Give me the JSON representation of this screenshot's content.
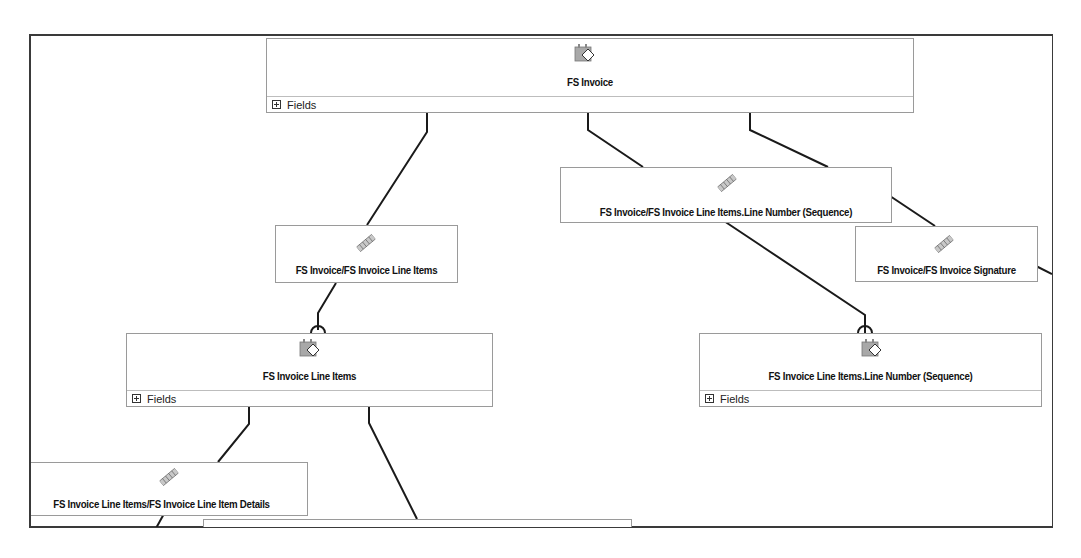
{
  "diagram": {
    "entities": [
      {
        "id": "fs-invoice",
        "title": "FS Invoice",
        "fields_label": "Fields",
        "icon": "entity-tag-icon"
      },
      {
        "id": "fs-invoice-line-items",
        "title": "FS Invoice Line Items",
        "fields_label": "Fields",
        "icon": "entity-tag-icon"
      },
      {
        "id": "fs-invoice-line-number",
        "title": "FS Invoice Line Items.Line Number (Sequence)",
        "fields_label": "Fields",
        "icon": "entity-tag-icon"
      }
    ],
    "relationships": [
      {
        "id": "rel-line-items",
        "title": "FS Invoice/FS Invoice Line Items",
        "icon": "relationship-chain-icon"
      },
      {
        "id": "rel-line-number",
        "title": "FS Invoice/FS Invoice Line Items.Line Number (Sequence)",
        "icon": "relationship-chain-icon"
      },
      {
        "id": "rel-signature",
        "title": "FS Invoice/FS Invoice Signature",
        "icon": "relationship-chain-icon"
      },
      {
        "id": "rel-line-item-details",
        "title": "FS Invoice Line Items/FS Invoice Line Item Details",
        "icon": "relationship-chain-icon"
      }
    ]
  },
  "colors": {
    "border": "#3a3a3a",
    "node_border": "#9a9a9a",
    "wire": "#1a1a1a",
    "icon_gray": "#a8a8a8"
  }
}
